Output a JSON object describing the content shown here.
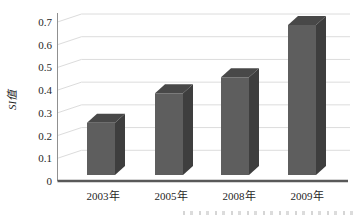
{
  "chart_data": {
    "type": "bar",
    "style": "3d-column",
    "title": "",
    "categories": [
      "2003年",
      "2005年",
      "2008年",
      "2009年"
    ],
    "values": [
      0.23,
      0.36,
      0.43,
      0.66
    ],
    "xlabel": "",
    "ylabel": "SI值",
    "ylim": [
      0,
      0.7
    ],
    "yticks": [
      "0.7",
      "0.6",
      "0.5",
      "0.4",
      "0.3",
      "0.2",
      "0.1",
      "0"
    ],
    "grid": true,
    "legend": false,
    "legend_position": "none"
  },
  "colors": {
    "bar_front": "#5e5e5e",
    "bar_top": "#484848",
    "bar_side": "#3e3e3e",
    "gridline": "#dcdcdc",
    "axis_line": "#909090",
    "baseline": "#595959",
    "text": "#262626",
    "background": "#ffffff"
  },
  "caption_fragment": {
    "note": "partially cropped caption text at bottom edge, illegible"
  }
}
